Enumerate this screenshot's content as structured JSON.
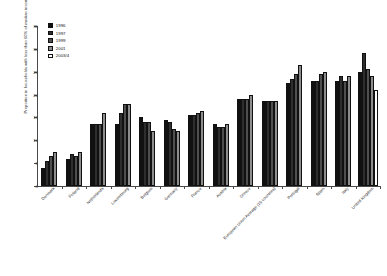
{
  "chart_data": {
    "type": "bar",
    "title": "",
    "xlabel": "",
    "ylabel": "Proportion in households with less than 60% of median income (BHC)",
    "ylim": [
      0,
      35
    ],
    "yticks": [
      0,
      5,
      10,
      15,
      20,
      25,
      30,
      35
    ],
    "grid": false,
    "legend_position": "top-left",
    "categories": [
      "Denmark",
      "Finland",
      "Netherlands",
      "Luxembourg",
      "Belgium",
      "Germany",
      "France",
      "Austria",
      "Greece",
      "European Union Average (15 countries)",
      "Portugal",
      "Spain",
      "Italy",
      "United Kingdom"
    ],
    "series": [
      {
        "name": "1996",
        "color": "#111111",
        "values": [
          4,
          6,
          13.5,
          13.5,
          15,
          14.5,
          15.5,
          13.5,
          19,
          18.5,
          22.5,
          23,
          23,
          25
        ]
      },
      {
        "name": "1997",
        "color": "#2e2e2e",
        "values": [
          5.5,
          7,
          13.5,
          16,
          14,
          14,
          15.5,
          13,
          19,
          18.5,
          23.5,
          23,
          24,
          29
        ]
      },
      {
        "name": "1999",
        "color": "#4f4f4f",
        "values": [
          6.5,
          6.5,
          13.5,
          18,
          14,
          12.5,
          16,
          13,
          19,
          18.5,
          24.5,
          24.5,
          23,
          25.5
        ]
      },
      {
        "name": "2001",
        "color": "#8d8d8d",
        "values": [
          7.5,
          7.5,
          16,
          18,
          12,
          12,
          16.5,
          13.5,
          20,
          18.5,
          26.5,
          25,
          24,
          24
        ]
      },
      {
        "name": "2003/4",
        "color": "#ffffff",
        "values": [
          null,
          null,
          null,
          null,
          null,
          null,
          null,
          null,
          null,
          null,
          null,
          null,
          null,
          21
        ]
      }
    ]
  },
  "legend": {
    "entries": [
      {
        "label": "1996",
        "swatch": "#111111"
      },
      {
        "label": "1997",
        "swatch": "#2e2e2e"
      },
      {
        "label": "1999",
        "swatch": "#4f4f4f"
      },
      {
        "label": "2001",
        "swatch": "#8d8d8d"
      },
      {
        "label": "2003/4",
        "swatch": "#ffffff"
      }
    ]
  },
  "axis": {
    "y_title": "Proportion in households with less than 60% of median income (BHC)",
    "y_ticks": [
      "0",
      "5",
      "10",
      "15",
      "20",
      "25",
      "30",
      "35"
    ]
  },
  "x_labels": [
    "Denmark",
    "Finland",
    "Netherlands",
    "Luxembourg",
    "Belgium",
    "Germany",
    "France",
    "Austria",
    "Greece",
    "European Union Average (15 countries)",
    "Portugal",
    "Spain",
    "Italy",
    "United Kingdom"
  ]
}
